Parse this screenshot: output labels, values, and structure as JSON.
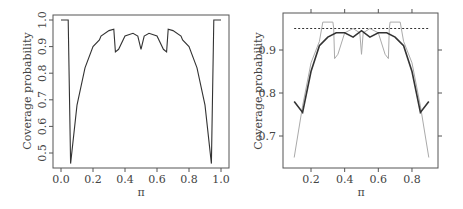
{
  "chart_data": [
    {
      "type": "line",
      "title": "",
      "xlabel": "π",
      "ylabel": "Coverage probability",
      "xlim": [
        0.0,
        1.0
      ],
      "ylim": [
        0.45,
        1.0
      ],
      "x_ticks": [
        "0.0",
        "0.2",
        "0.4",
        "0.6",
        "0.8",
        "1.0"
      ],
      "y_ticks": [
        "0.5",
        "0.6",
        "0.7",
        "0.8",
        "0.9",
        "1.0"
      ],
      "grid": false,
      "series": [
        {
          "name": "coverage",
          "color": "#333333",
          "x": [
            0.0,
            0.04,
            0.045,
            0.06,
            0.1,
            0.15,
            0.2,
            0.24,
            0.25,
            0.3,
            0.33,
            0.34,
            0.36,
            0.4,
            0.45,
            0.48,
            0.5,
            0.52,
            0.55,
            0.6,
            0.64,
            0.66,
            0.67,
            0.7,
            0.75,
            0.76,
            0.8,
            0.85,
            0.9,
            0.94,
            0.955,
            0.96,
            1.0
          ],
          "y": [
            1.0,
            1.0,
            1.0,
            0.46,
            0.68,
            0.82,
            0.9,
            0.925,
            0.94,
            0.96,
            0.965,
            0.88,
            0.89,
            0.94,
            0.95,
            0.94,
            0.89,
            0.94,
            0.95,
            0.94,
            0.89,
            0.88,
            0.965,
            0.96,
            0.94,
            0.925,
            0.9,
            0.82,
            0.68,
            0.46,
            1.0,
            1.0,
            1.0
          ]
        }
      ]
    },
    {
      "type": "line",
      "title": "",
      "xlabel": "π",
      "ylabel": "Coverage probability",
      "xlim": [
        0.05,
        0.95
      ],
      "ylim": [
        0.63,
        0.97
      ],
      "x_ticks": [
        "0.2",
        "0.4",
        "0.6",
        "0.8"
      ],
      "y_ticks": [
        "0.7",
        "0.8",
        "0.9"
      ],
      "grid": false,
      "reference_line": {
        "y": 0.95,
        "style": "dotted"
      },
      "series": [
        {
          "name": "smoothed coverage (dark)",
          "color": "#333333",
          "x": [
            0.1,
            0.15,
            0.2,
            0.25,
            0.3,
            0.35,
            0.4,
            0.45,
            0.5,
            0.55,
            0.6,
            0.65,
            0.7,
            0.75,
            0.8,
            0.85,
            0.9
          ],
          "y": [
            0.78,
            0.755,
            0.85,
            0.91,
            0.93,
            0.94,
            0.94,
            0.93,
            0.945,
            0.93,
            0.94,
            0.94,
            0.93,
            0.91,
            0.85,
            0.755,
            0.78
          ]
        },
        {
          "name": "exact coverage (light)",
          "color": "#aaaaaa",
          "x": [
            0.1,
            0.15,
            0.2,
            0.25,
            0.27,
            0.33,
            0.335,
            0.34,
            0.36,
            0.4,
            0.45,
            0.49,
            0.5,
            0.51,
            0.55,
            0.6,
            0.64,
            0.66,
            0.665,
            0.67,
            0.73,
            0.75,
            0.8,
            0.85,
            0.9
          ],
          "y": [
            0.65,
            0.77,
            0.87,
            0.92,
            0.965,
            0.965,
            0.95,
            0.88,
            0.89,
            0.94,
            0.95,
            0.94,
            0.89,
            0.94,
            0.95,
            0.94,
            0.89,
            0.88,
            0.95,
            0.965,
            0.965,
            0.92,
            0.87,
            0.77,
            0.65
          ]
        }
      ]
    }
  ]
}
